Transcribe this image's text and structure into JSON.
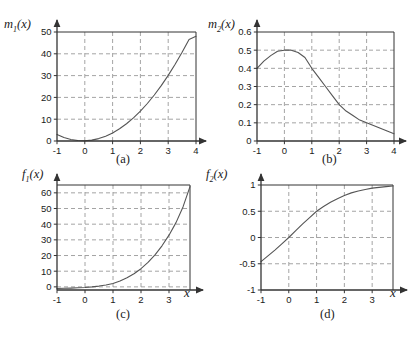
{
  "figure": {
    "background": "#ffffff",
    "curve_color": "#555555",
    "grid_color": "#9a9a9a",
    "axis_color": "#333333"
  },
  "panels": [
    {
      "id": "a",
      "caption": "(a)",
      "ylabel_main": "m",
      "ylabel_sub": "1",
      "ylabel_arg": "(x)",
      "xlabel": "",
      "chart_data": {
        "type": "line",
        "title": "m₁(x)",
        "xlabel": "x",
        "ylabel": "m₁(x)",
        "xlim": [
          -1,
          4
        ],
        "ylim": [
          0,
          50
        ],
        "xticks": [
          -1,
          0,
          1,
          2,
          3,
          4
        ],
        "yticks": [
          0,
          10,
          20,
          30,
          40,
          50
        ],
        "grid": true,
        "legend": "none",
        "x": [
          -1,
          -0.75,
          -0.5,
          -0.25,
          0,
          0.25,
          0.5,
          0.75,
          1,
          1.25,
          1.5,
          1.75,
          2,
          2.25,
          2.5,
          2.75,
          3,
          3.25,
          3.5,
          3.75,
          4
        ],
        "y": [
          3,
          1.6,
          0.7,
          0.2,
          0.1,
          0.4,
          1.1,
          2.2,
          3.7,
          5.6,
          7.9,
          10.6,
          13.7,
          17.2,
          21.1,
          25.4,
          30.1,
          35.2,
          40.7,
          46.6,
          48
        ]
      }
    },
    {
      "id": "b",
      "caption": "(b)",
      "ylabel_main": "m",
      "ylabel_sub": "2",
      "ylabel_arg": "(x)",
      "xlabel": "",
      "chart_data": {
        "type": "line",
        "title": "m₂(x)",
        "xlabel": "x",
        "ylabel": "m₂(x)",
        "xlim": [
          -1,
          4
        ],
        "ylim": [
          0,
          0.6
        ],
        "xticks": [
          -1,
          0,
          1,
          2,
          3,
          4
        ],
        "yticks": [
          0,
          0.1,
          0.2,
          0.3,
          0.4,
          0.5,
          0.6
        ],
        "grid": true,
        "legend": "none",
        "x": [
          -1,
          -0.75,
          -0.5,
          -0.25,
          0,
          0.25,
          0.5,
          0.75,
          1,
          1.25,
          1.5,
          1.75,
          2,
          2.25,
          2.5,
          2.75,
          3,
          3.25,
          3.5,
          3.75,
          4
        ],
        "y": [
          0.4,
          0.44,
          0.47,
          0.494,
          0.5,
          0.5,
          0.487,
          0.46,
          0.4,
          0.35,
          0.3,
          0.25,
          0.2,
          0.165,
          0.14,
          0.115,
          0.1,
          0.085,
          0.07,
          0.055,
          0.04
        ]
      }
    },
    {
      "id": "c",
      "caption": "(c)",
      "ylabel_main": "f",
      "ylabel_sub": "1",
      "ylabel_arg": "(x)",
      "xlabel": "x",
      "chart_data": {
        "type": "line",
        "title": "f₁(x)",
        "xlabel": "x",
        "ylabel": "f₁(x)",
        "xlim": [
          -1,
          3.75
        ],
        "ylim": [
          -2,
          65
        ],
        "xticks": [
          -1,
          0,
          1,
          2,
          3
        ],
        "yticks": [
          0,
          10,
          20,
          30,
          40,
          50,
          60
        ],
        "grid": true,
        "legend": "none",
        "x": [
          -1,
          -0.75,
          -0.5,
          -0.25,
          0,
          0.25,
          0.5,
          0.75,
          1,
          1.25,
          1.5,
          1.75,
          2,
          2.25,
          2.5,
          2.75,
          3,
          3.25,
          3.5,
          3.75
        ],
        "y": [
          -1,
          -0.9,
          -0.8,
          -0.6,
          -0.4,
          0,
          0.5,
          1.2,
          2.2,
          3.8,
          5.8,
          8.4,
          11.6,
          15.6,
          20.4,
          26.2,
          33,
          41,
          51,
          64
        ]
      }
    },
    {
      "id": "d",
      "caption": "(d)",
      "ylabel_main": "f",
      "ylabel_sub": "2",
      "ylabel_arg": "(x)",
      "xlabel": "x",
      "chart_data": {
        "type": "line",
        "title": "f₂(x)",
        "xlabel": "x",
        "ylabel": "f₂(x)",
        "xlim": [
          -1,
          3.75
        ],
        "ylim": [
          -1,
          1
        ],
        "xticks": [
          -1,
          0,
          1,
          2,
          3
        ],
        "yticks": [
          -1,
          -0.5,
          0,
          0.5,
          1
        ],
        "grid": true,
        "legend": "none",
        "x": [
          -1,
          -0.75,
          -0.5,
          -0.25,
          0,
          0.25,
          0.5,
          0.75,
          1,
          1.25,
          1.5,
          1.75,
          2,
          2.25,
          2.5,
          2.75,
          3,
          3.25,
          3.5,
          3.75
        ],
        "y": [
          -0.46,
          -0.35,
          -0.24,
          -0.12,
          0,
          0.13,
          0.26,
          0.38,
          0.5,
          0.59,
          0.67,
          0.74,
          0.8,
          0.85,
          0.885,
          0.915,
          0.94,
          0.955,
          0.97,
          0.98
        ]
      }
    }
  ]
}
